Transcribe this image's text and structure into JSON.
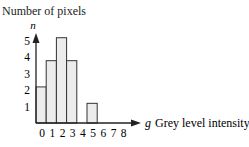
{
  "chart_data": {
    "type": "bar",
    "title": "Number of pixels",
    "ylabel": "n",
    "xlabel_symbol": "g",
    "xlabel": "Grey level intensity",
    "categories": [
      "0",
      "1",
      "2",
      "3",
      "4",
      "5",
      "6",
      "7",
      "8"
    ],
    "values": [
      2.2,
      3.8,
      5.2,
      3.8,
      0,
      1.2,
      0,
      0,
      0
    ],
    "yticks": [
      "1",
      "2",
      "3",
      "4",
      "5"
    ],
    "ylim": [
      0,
      5.5
    ],
    "grid": false,
    "legend": null,
    "bar_fill": "#ececec",
    "bar_stroke": "#333333"
  }
}
